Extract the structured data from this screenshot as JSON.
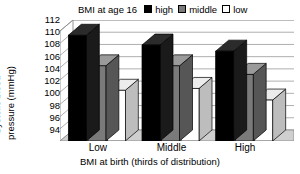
{
  "chart_data": {
    "type": "bar",
    "title": "",
    "xlabel": "BMI at birth (thirds of distribution)",
    "ylabel": "Systolic blood pressure (mmHg)",
    "ylabel_lines": [
      "Systolic blood",
      "pressure (mmHg)"
    ],
    "categories": [
      "Low",
      "Middle",
      "High"
    ],
    "ylim": [
      94,
      112
    ],
    "ytick_step": 2,
    "yticks": [
      112,
      110,
      108,
      106,
      104,
      102,
      100,
      98,
      96,
      94
    ],
    "grid": true,
    "style": "3d-bars",
    "legend": {
      "title": "BMI at age 16",
      "position": "top",
      "entries": [
        {
          "name": "high",
          "color": "#000000"
        },
        {
          "name": "middle",
          "color": "#7a7a7a"
        },
        {
          "name": "low",
          "color": "#ffffff"
        }
      ]
    },
    "series": [
      {
        "name": "high",
        "color": "#000000",
        "values": [
          111.3,
          109.7,
          108.7
        ]
      },
      {
        "name": "middle",
        "color": "#7a7a7a",
        "values": [
          106.3,
          106.3,
          104.9
        ]
      },
      {
        "name": "low",
        "color": "#ffffff",
        "values": [
          102.3,
          102.6,
          100.7
        ]
      }
    ]
  }
}
